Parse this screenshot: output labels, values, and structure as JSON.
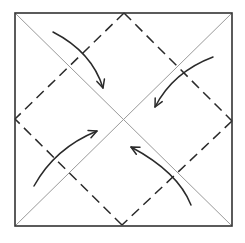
{
  "diagram": {
    "type": "origami-fold-diagram",
    "colors": {
      "background": "#ffffff",
      "outline": "#333333",
      "diagonal_crease": "#9a9a9a",
      "valley_fold": "#2a2a2a",
      "arrow": "#2a2a2a"
    },
    "square": {
      "x1": 15,
      "y1": 13,
      "x2": 232,
      "y2": 226
    },
    "center": {
      "x": 123,
      "y": 119
    },
    "diagonals": [
      {
        "name": "diagonal-tl-br",
        "from": [
          15,
          13
        ],
        "to": [
          232,
          226
        ]
      },
      {
        "name": "diagonal-tr-bl",
        "from": [
          232,
          13
        ],
        "to": [
          15,
          226
        ]
      }
    ],
    "valley_folds": [
      {
        "name": "fold-top-left",
        "from": [
          124,
          13
        ],
        "to": [
          15,
          119
        ]
      },
      {
        "name": "fold-top-right",
        "from": [
          124,
          13
        ],
        "to": [
          232,
          121
        ]
      },
      {
        "name": "fold-bottom-right",
        "from": [
          232,
          121
        ],
        "to": [
          122,
          225
        ]
      },
      {
        "name": "fold-bottom-left",
        "from": [
          122,
          225
        ],
        "to": [
          15,
          119
        ]
      }
    ],
    "arrows": [
      {
        "name": "arrow-top-left-corner",
        "path": "M53 32 Q92 52 103 88",
        "head_tip": [
          103,
          88
        ]
      },
      {
        "name": "arrow-right-corner",
        "path": "M213 57 Q173 72 155 107",
        "head_tip": [
          155,
          107
        ]
      },
      {
        "name": "arrow-bottom-left-corner",
        "path": "M34 186 Q55 148 97 131",
        "head_tip": [
          97,
          131
        ]
      },
      {
        "name": "arrow-bottom-right-corner",
        "path": "M191 205 Q178 172 131 147",
        "head_tip": [
          131,
          147
        ]
      }
    ]
  }
}
